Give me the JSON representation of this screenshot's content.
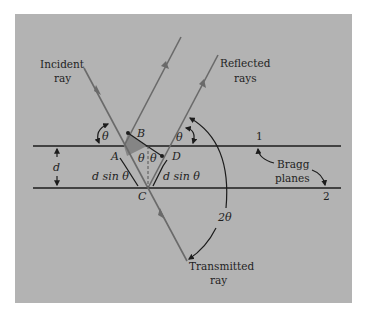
{
  "diagram": {
    "colors": {
      "panel": "#b3b3b3",
      "ray": "#6a6a6a",
      "plane": "#1c1c1c",
      "annotation": "#1c1c1c",
      "shaded_triangle": "#858585"
    },
    "labels": {
      "incident_line1": "Incident",
      "incident_line2": "ray",
      "reflected_line1": "Reflected",
      "reflected_line2": "rays",
      "transmitted_line1": "Transmitted",
      "transmitted_line2": "ray",
      "bragg_line1": "Bragg",
      "bragg_line2": "planes",
      "plane1": "1",
      "plane2": "2",
      "spacing": "d",
      "point_a": "A",
      "point_b": "B",
      "point_c": "C",
      "point_d": "D",
      "theta_incident": "θ",
      "theta_reflected": "θ",
      "theta_left_c": "θ",
      "theta_right_c": "θ",
      "path_left": "d sin θ",
      "path_right": "d sin θ",
      "two_theta": "2θ"
    }
  }
}
